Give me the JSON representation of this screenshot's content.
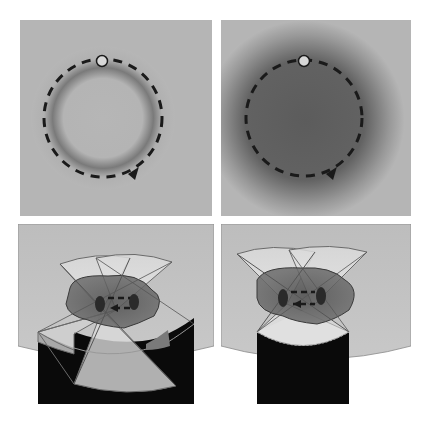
{
  "figure": {
    "panels": [
      {
        "id": "top-left",
        "description": "Circular dashed trajectory with start marker, uniform background; faint halo along ring",
        "interior": "light"
      },
      {
        "id": "top-right",
        "description": "Circular dashed trajectory with start marker, dark filled interior region",
        "interior": "dark"
      },
      {
        "id": "bottom-left",
        "description": "Two overlapping fan-shaped fields over dark blob with dashed loop; notched dark base"
      },
      {
        "id": "bottom-right",
        "description": "Two overlapping fan-shaped fields over dark blob with dashed loop; curved dark base"
      }
    ],
    "colors": {
      "background": "#b4b4b4",
      "ring_dash": "#1a1a1a",
      "dark_region": "#5a5a5a",
      "blob": "#6e6e6e",
      "fan": "#d8d8d8",
      "base": "#0a0a0a",
      "marker_fill": "#d8d8d8"
    }
  }
}
